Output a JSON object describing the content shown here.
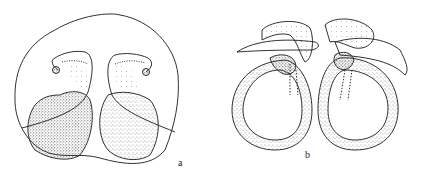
{
  "figure": {
    "panels": [
      {
        "id": "a",
        "label": "a",
        "description": "stippled drawing, rounded outline enclosing two lobed stippled bodies with coiled tubes"
      },
      {
        "id": "b",
        "label": "b",
        "description": "stippled drawing, two looped stippled ring structures with hooked apical processes"
      }
    ]
  },
  "colors": {
    "ink": "#1a1a1a",
    "background": "#ffffff"
  }
}
